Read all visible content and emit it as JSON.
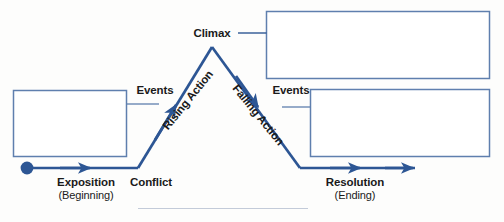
{
  "diagram": {
    "colors": {
      "line": "#2d5694",
      "line_light": "#3c6bab",
      "box_border": "#5f7fae",
      "box_fill": "#ffffff",
      "text": "#1a1a1a",
      "background": "#fdfdfc",
      "faint_rule": "#c3cbd9"
    },
    "stages": [
      {
        "id": "exposition",
        "label": "Exposition",
        "sublabel": "(Beginning)"
      },
      {
        "id": "conflict",
        "label": "Conflict",
        "sublabel": ""
      },
      {
        "id": "rising-action",
        "label": "Rising Action",
        "sublabel": ""
      },
      {
        "id": "climax",
        "label": "Climax",
        "sublabel": ""
      },
      {
        "id": "falling-action",
        "label": "Falling Action",
        "sublabel": ""
      },
      {
        "id": "resolution",
        "label": "Resolution",
        "sublabel": "(Ending)"
      }
    ],
    "events": [
      {
        "id": "events-left",
        "label": "Events"
      },
      {
        "id": "events-right",
        "label": "Events"
      }
    ],
    "answer_boxes": [
      {
        "id": "box-exposition",
        "value": ""
      },
      {
        "id": "box-climax",
        "value": ""
      },
      {
        "id": "box-resolution",
        "value": ""
      }
    ]
  }
}
